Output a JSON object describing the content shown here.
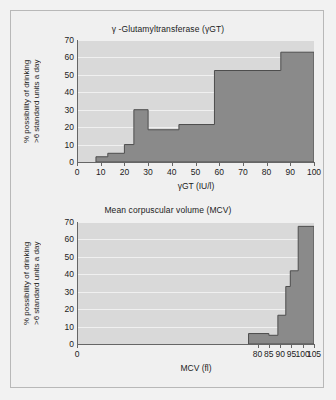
{
  "figure": {
    "background": "#f0f0f0",
    "border_color": "#b8b8b8",
    "plot_background": "#d9d9d9",
    "series_fill": "#8a8a8a",
    "series_stroke": "#4d4d4d",
    "grid_color": "#f0f0f0"
  },
  "chart_data": [
    {
      "type": "area",
      "id": "gamma-gt",
      "title": "γ -Glutamyltransferase (γGT)",
      "xlabel": "γGT (IU/l)",
      "ylabel": "% possibility of drinking\n>6 standard units a day",
      "xlim": [
        0,
        100
      ],
      "ylim": [
        0,
        70
      ],
      "xticks": [
        0,
        10,
        20,
        30,
        40,
        50,
        60,
        70,
        80,
        90,
        100
      ],
      "xticklabels": [
        "0",
        "10",
        "20",
        "30",
        "40",
        "50",
        "60",
        "70",
        "80",
        "90",
        "100"
      ],
      "yticks": [
        0,
        10,
        20,
        30,
        40,
        50,
        60,
        70
      ],
      "yticklabels": [
        "0",
        "10",
        "20",
        "30",
        "40",
        "50",
        "60",
        "70"
      ],
      "grid": true,
      "grid_axis": "y",
      "legend": "none",
      "steps": [
        {
          "x_start": 8,
          "x_end": 13,
          "value": 3
        },
        {
          "x_start": 13,
          "x_end": 20,
          "value": 5
        },
        {
          "x_start": 20,
          "x_end": 24,
          "value": 10
        },
        {
          "x_start": 24,
          "x_end": 30,
          "value": 30
        },
        {
          "x_start": 30,
          "x_end": 43,
          "value": 18.5
        },
        {
          "x_start": 43,
          "x_end": 58,
          "value": 21.5
        },
        {
          "x_start": 58,
          "x_end": 86,
          "value": 52.5
        },
        {
          "x_start": 86,
          "x_end": 100,
          "value": 63
        }
      ]
    },
    {
      "type": "area",
      "id": "mcv",
      "title": "Mean corpuscular volume (MCV)",
      "xlabel": "MCV (fl)",
      "ylabel": "% possibility of drinking\n>6 standard units a day",
      "xlim": [
        0,
        105
      ],
      "ylim": [
        0,
        70
      ],
      "xticks": [
        0,
        80,
        85,
        90,
        95,
        100,
        105
      ],
      "xticklabels": [
        "0",
        "80",
        "85",
        "90",
        "95",
        "100",
        "105"
      ],
      "yticks": [
        0,
        10,
        20,
        30,
        40,
        50,
        60,
        70
      ],
      "yticklabels": [
        "0",
        "10",
        "20",
        "30",
        "40",
        "50",
        "60",
        "70"
      ],
      "grid": true,
      "grid_axis": "y",
      "legend": "none",
      "steps": [
        {
          "x_start": 76,
          "x_end": 85,
          "value": 6
        },
        {
          "x_start": 85,
          "x_end": 89,
          "value": 5
        },
        {
          "x_start": 89,
          "x_end": 92.5,
          "value": 16.5
        },
        {
          "x_start": 92.5,
          "x_end": 94.5,
          "value": 33
        },
        {
          "x_start": 94.5,
          "x_end": 98,
          "value": 42
        },
        {
          "x_start": 98,
          "x_end": 105,
          "value": 67.5
        }
      ]
    }
  ]
}
